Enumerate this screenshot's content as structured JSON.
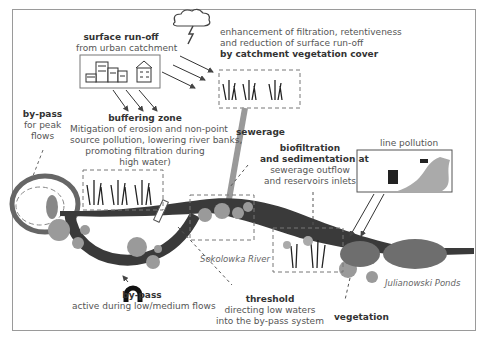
{
  "diagram": {
    "surface_runoff": {
      "title": "surface run-off",
      "subtitle": "from urban catchment"
    },
    "catchment_vegetation": {
      "line1": "enhancement of filtration, retentiveness",
      "line2": "and reduction of surface run-off",
      "line3": "by catchment vegetation cover"
    },
    "buffering_zone": {
      "title": "buffering zone",
      "line1": "Mitigation of erosion and non-point",
      "line2": "source pollution, lowering river banks,",
      "line3": "promoting filtration during",
      "line4": "high water)"
    },
    "bypass_peak": {
      "title": "by-pass",
      "line1": "for peak",
      "line2": "flows"
    },
    "sewerage": {
      "title": "sewerage"
    },
    "biofiltration": {
      "title1": "biofiltration",
      "title2": "and sedimentation at",
      "line1": "sewerage outflow",
      "line2": "and reservoirs inlets"
    },
    "line_pollution": {
      "title": "line pollution"
    },
    "river": {
      "name": "Sokolowka River"
    },
    "ponds": {
      "name": "Julianowski Ponds"
    },
    "bypass_low": {
      "title": "by-pass",
      "subtitle": "active during low/medium flows"
    },
    "threshold": {
      "title": "threshold",
      "line1": "directing low waters",
      "line2": "into the by-pass system"
    },
    "vegetation": {
      "title": "vegetation"
    },
    "icons": [
      "storm-cloud-icon",
      "urban-buildings-icon",
      "house-icon",
      "reed-vegetation-icon",
      "car-icon",
      "truck-icon",
      "bypass-pipe-icon"
    ],
    "colors": {
      "river": "#3a3a3a",
      "pond": "#6e6e6e",
      "bush": "#999999",
      "frame": "#9a9a9a",
      "text": "#555555"
    }
  }
}
